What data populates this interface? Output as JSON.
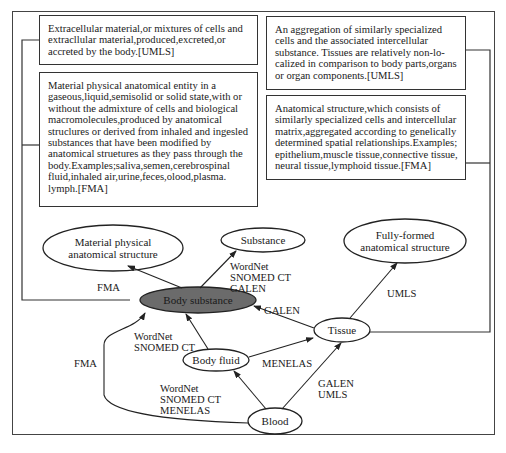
{
  "definitions": {
    "substance_umls": "Extracellular material,or mixtures of cells and extracllular material,produced,excreted,or accreted by the body.[UMLS]",
    "substance_fma": "Material physical anatomical entity in a gaseous,liquid,semisolid or solid state,with or without the admixture of cells and biological macromolecules,produced by anatomical struclures or derived from inhaled and ingesled substances that have been modified by anatomical struetures as they pass through the body.Examples;saliva,semen,cerebrospinal fluid,inhaled air,urine,feces,olood,plasma. lymph.[FMA]",
    "tissue_umls": "An aggregation of similarly specialized cells and the associated intercellular substance. Tissues are relatively non-lo-calized in comparison to body parts,organs or organ components.[UMLS]",
    "tissue_fma": "Anatomical structure,which consists of similarly specialized cells and intercellular matrix,aggregated according to genelically determined spatial relationships.Examples; epithelium,muscle tissue,connective tissue, neural tissue,lymphoid tissue.[FMA]"
  },
  "nodes": {
    "material_physical": "Material physical\nanatomical structure",
    "substance": "Substance",
    "fully_formed": "Fully-formed\nanatomical structure",
    "body_substance": "Body substance",
    "tissue": "Tissue",
    "body_fluid": "Body fluid",
    "blood": "Blood"
  },
  "edges": {
    "body_substance_to_material": "FMA",
    "body_substance_to_substance": "WordNet\nSNOMED CT\nGALEN",
    "tissue_to_body_substance": "GALEN",
    "tissue_to_fully_formed": "UMLS",
    "blood_to_body_substance": "FMA",
    "body_fluid_to_body_substance": "WordNet\nSNOMED CT",
    "body_fluid_to_tissue": "MENELAS",
    "blood_to_body_fluid": "WordNet\nSNOMED CT\nMENELAS",
    "blood_to_tissue": "GALEN\nUMLS"
  },
  "colors": {
    "stroke": "#333333",
    "highlight_fill": "#6b6b6b",
    "background": "#ffffff"
  }
}
